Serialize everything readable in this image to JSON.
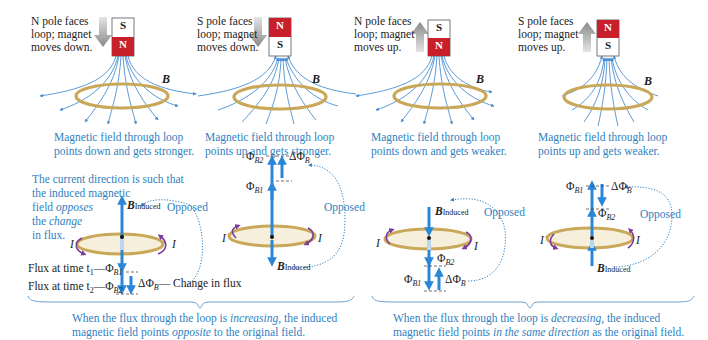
{
  "colors": {
    "field_line": "#4a8fd0",
    "flux_arrow": "#2a86d6",
    "caption_text": "#2f7fc1",
    "magnet_red": "#c8202a",
    "magnet_white": "#ffffff",
    "loop_gold": "#c9a85a",
    "loop_fill": "#f6efdc",
    "current_arrow": "#7b3b9a",
    "motion_arrow": "#9a9a9a",
    "opposed_dots": "#2f7fc1"
  },
  "top_panels": [
    {
      "motion_label_lines": [
        "N pole faces",
        "loop; magnet",
        "moves down."
      ],
      "magnet_top": "S",
      "magnet_bottom": "N",
      "motion": "down",
      "field_label": "B",
      "caption_lines": [
        "Magnetic field through loop",
        "points down and gets stronger."
      ]
    },
    {
      "motion_label_lines": [
        "S pole faces",
        "loop; magnet",
        "moves down."
      ],
      "magnet_top": "N",
      "magnet_bottom": "S",
      "motion": "down",
      "field_label": "B",
      "caption_lines": [
        "Magnetic field through loop",
        "points up and gets stronger."
      ]
    },
    {
      "motion_label_lines": [
        "N pole faces",
        "loop; magnet",
        "moves up."
      ],
      "magnet_top": "S",
      "magnet_bottom": "N",
      "motion": "up",
      "field_label": "B",
      "caption_lines": [
        "Magnetic field through loop",
        "points down and gets weaker."
      ]
    },
    {
      "motion_label_lines": [
        "S pole faces",
        "loop; magnet",
        "moves up."
      ],
      "magnet_top": "N",
      "magnet_bottom": "S",
      "motion": "up",
      "field_label": "B",
      "caption_lines": [
        "Magnetic field through loop",
        "points up and gets weaker."
      ]
    }
  ],
  "bottom_panels": {
    "intro_lines": [
      "The current direction is such that",
      "the induced magnetic",
      "field ",
      "opposes",
      "the ",
      "change",
      "in flux."
    ],
    "flux_t1_prefix": "Flux at time t",
    "flux_t1_sub": "1",
    "flux_t1_suffix": "—Φ",
    "flux_t1_phi_sub": "B1",
    "flux_t2_prefix": "Flux at time t",
    "flux_t2_sub": "2",
    "flux_t2_suffix": "—Φ",
    "flux_t2_phi_sub": "B2",
    "delta_label": "ΔΦ",
    "delta_sub": "B",
    "change_in_flux": "— Change in flux",
    "opposed": "Opposed",
    "b_induced_main": "B",
    "b_induced_sub": "Induced",
    "current": "I",
    "phi": "Φ",
    "phi_b1_sub": "B1",
    "phi_b2_sub": "B2"
  },
  "summaries": {
    "increasing": {
      "line1_pre": "When the flux through the loop is ",
      "line1_em": "increasing",
      "line1_post": ", the induced",
      "line2_pre": "magnetic field points ",
      "line2_em": "opposite",
      "line2_post": " to the original field."
    },
    "decreasing": {
      "line1_pre": "When the flux through the loop is ",
      "line1_em": "decreasing",
      "line1_post": ", the induced",
      "line2_pre": "magnetic field points ",
      "line2_em": "in the same direction",
      "line2_post": " as the original field."
    }
  }
}
